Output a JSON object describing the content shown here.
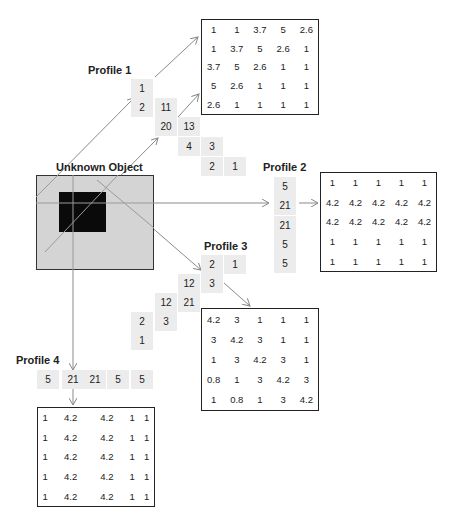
{
  "object": {
    "title": "Unknown Object",
    "outer_color": "#d4d4d4",
    "inner_color": "#0a0a0a"
  },
  "profiles": [
    {
      "label": "Profile 1",
      "projection": [
        "1",
        "2",
        "11",
        "20",
        "13",
        "4",
        "3",
        "2",
        "1"
      ]
    },
    {
      "label": "Profile 2",
      "projection": [
        "5",
        "21",
        "21",
        "5",
        "5"
      ]
    },
    {
      "label": "Profile 3",
      "projection": [
        "2",
        "1",
        "12",
        "3",
        "12",
        "21",
        "2",
        "3",
        "1"
      ]
    },
    {
      "label": "Profile 4",
      "projection": [
        "5",
        "21",
        "21",
        "5",
        "5"
      ]
    }
  ],
  "matrices": {
    "m1": [
      [
        "1",
        "1",
        "3.7",
        "5",
        "2.6"
      ],
      [
        "1",
        "3.7",
        "5",
        "2.6",
        "1"
      ],
      [
        "3.7",
        "5",
        "2.6",
        "1",
        "1"
      ],
      [
        "5",
        "2.6",
        "1",
        "1",
        "1"
      ],
      [
        "2.6",
        "1",
        "1",
        "1",
        "1"
      ]
    ],
    "m2": [
      [
        "1",
        "1",
        "1",
        "1",
        "1"
      ],
      [
        "4.2",
        "4.2",
        "4.2",
        "4.2",
        "4.2"
      ],
      [
        "4.2",
        "4.2",
        "4.2",
        "4.2",
        "4.2"
      ],
      [
        "1",
        "1",
        "1",
        "1",
        "1"
      ],
      [
        "1",
        "1",
        "1",
        "1",
        "1"
      ]
    ],
    "m3": [
      [
        "4.2",
        "3",
        "1",
        "1",
        "1"
      ],
      [
        "3",
        "4.2",
        "3",
        "1",
        "1"
      ],
      [
        "1",
        "3",
        "4.2",
        "3",
        "1"
      ],
      [
        "0.8",
        "1",
        "3",
        "4.2",
        "3"
      ],
      [
        "1",
        "0.8",
        "1",
        "3",
        "4.2"
      ]
    ],
    "m4": [
      [
        "1",
        "4.2",
        "4.2",
        "1",
        "1"
      ],
      [
        "1",
        "4.2",
        "4.2",
        "1",
        "1"
      ],
      [
        "1",
        "4.2",
        "4.2",
        "1",
        "1"
      ],
      [
        "1",
        "4.2",
        "4.2",
        "1",
        "1"
      ],
      [
        "1",
        "4.2",
        "4.2",
        "1",
        "1"
      ]
    ]
  }
}
